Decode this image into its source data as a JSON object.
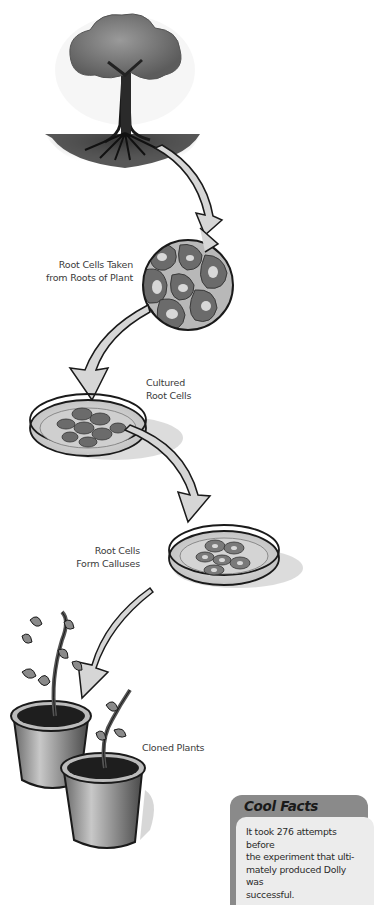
{
  "diagram": {
    "steps": [
      {
        "id": "tree",
        "label_lines": []
      },
      {
        "id": "root-cells",
        "label_lines": [
          "Root Cells Taken",
          "from Roots of Plant"
        ]
      },
      {
        "id": "cultured",
        "label_lines": [
          "Cultured",
          "Root Cells"
        ]
      },
      {
        "id": "calluses",
        "label_lines": [
          "Root Cells",
          "Form Calluses"
        ]
      },
      {
        "id": "cloned",
        "label_lines": [
          "Cloned Plants"
        ]
      }
    ]
  },
  "cool_facts": {
    "title": "Cool Facts",
    "text_lines": [
      "It took 276 attempts before",
      "the experiment that ulti-",
      "mately produced Dolly was",
      "successful."
    ]
  },
  "colors": {
    "ink": "#1a1a1a",
    "foliage": "#7a7a7a",
    "cell": "#6b6b6b",
    "cell_bg": "#b8b8b8",
    "arrow_fill": "#d6d6d6",
    "facts_header": "#8a8a8a",
    "facts_body": "#ececec"
  }
}
